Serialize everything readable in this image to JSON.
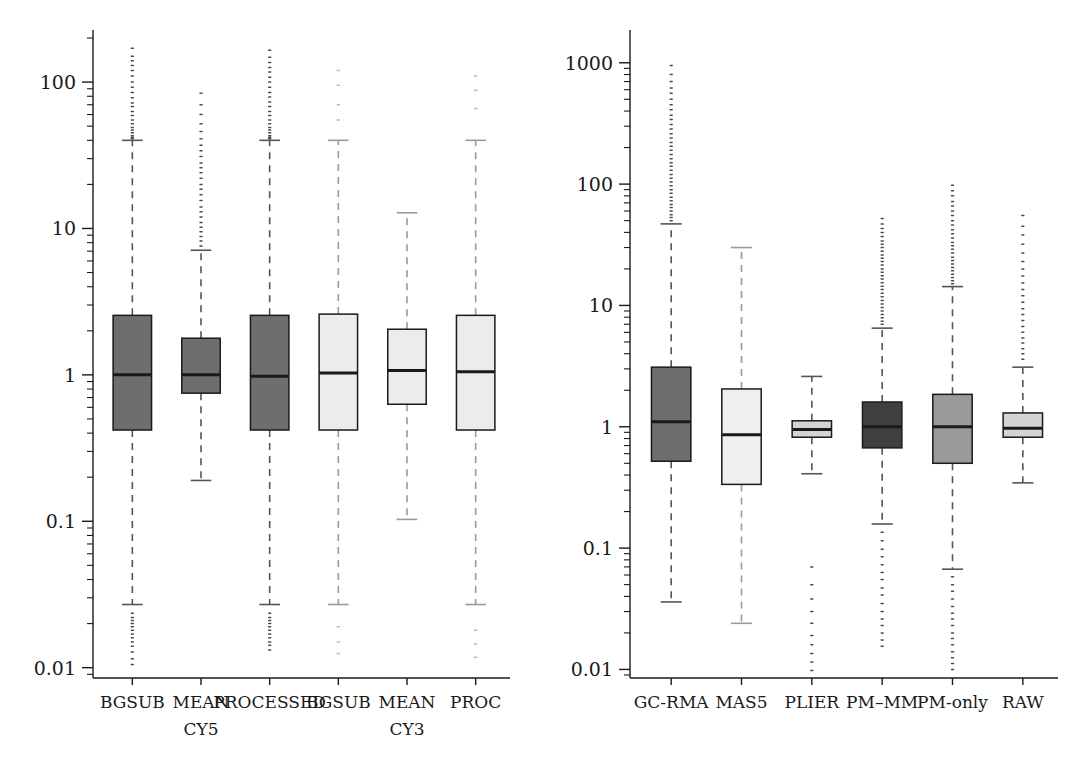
{
  "figure": {
    "type": "boxplot-figure",
    "panel_count": 2,
    "background": "#ffffff",
    "ink": "#1a1a1a"
  },
  "chart_data": [
    {
      "type": "box",
      "panel": "left",
      "title": "",
      "xlabel": "",
      "ylabel": "",
      "yscale": "log",
      "ylim": [
        0.0085,
        200
      ],
      "grid": false,
      "legend": "none",
      "ytick_labels": [
        "100",
        "10",
        "1",
        "0.1",
        "0.01"
      ],
      "ytick_values": [
        100,
        10,
        1,
        0.1,
        0.01
      ],
      "categories": [
        "BGSUB",
        "MEAN CY5",
        "PROCESSED",
        "BGSUB",
        "MEAN CY3",
        "PROC"
      ],
      "category_lines": [
        [
          "BGSUB",
          ""
        ],
        [
          "MEAN",
          "CY5"
        ],
        [
          "PROCESSED",
          ""
        ],
        [
          "BGSUB",
          ""
        ],
        [
          "MEAN",
          "CY3"
        ],
        [
          "PROC",
          ""
        ]
      ],
      "boxes": [
        {
          "label": "BGSUB",
          "fill": "#6e6e6e",
          "q1": 0.42,
          "median": 1.0,
          "q3": 2.55,
          "whisker_low": 0.027,
          "whisker_high": 40,
          "outliers_high": [
            170,
            150,
            140,
            130,
            120,
            110,
            100,
            92,
            85,
            78,
            72,
            68,
            63,
            59,
            55,
            52,
            49,
            47,
            45,
            43,
            42,
            41
          ],
          "outliers_low": [
            0.0235,
            0.022,
            0.021,
            0.02,
            0.019,
            0.018,
            0.017,
            0.016,
            0.015,
            0.014,
            0.0128,
            0.0115,
            0.0105
          ]
        },
        {
          "label": "MEAN CY5",
          "fill": "#6e6e6e",
          "q1": 0.75,
          "median": 1.0,
          "q3": 1.78,
          "whisker_low": 0.19,
          "whisker_high": 7.1,
          "outliers_high": [
            84,
            70,
            60,
            52,
            46,
            41,
            37,
            34,
            31,
            28,
            26,
            24,
            22,
            20,
            18.5,
            17,
            15.5,
            14,
            13,
            12,
            11,
            10.2,
            9.5,
            8.8,
            8.2,
            7.6
          ],
          "outliers_low": []
        },
        {
          "label": "PROCESSED",
          "fill": "#6e6e6e",
          "q1": 0.42,
          "median": 0.98,
          "q3": 2.55,
          "whisker_low": 0.027,
          "whisker_high": 40,
          "outliers_high": [
            165,
            148,
            136,
            126,
            117,
            108,
            100,
            92,
            85,
            79,
            73,
            68,
            63,
            59,
            55,
            52,
            49,
            47,
            45,
            43,
            42,
            41
          ],
          "outliers_low": [
            0.0235,
            0.022,
            0.021,
            0.02,
            0.019,
            0.018,
            0.017,
            0.016,
            0.015,
            0.0142,
            0.0132
          ]
        },
        {
          "label": "BGSUB",
          "fill": "#ececec",
          "q1": 0.42,
          "median": 1.03,
          "q3": 2.6,
          "whisker_low": 0.027,
          "whisker_high": 40,
          "outliers_high": [
            120,
            95,
            70,
            55
          ],
          "outliers_low": [
            0.019,
            0.015,
            0.0125
          ]
        },
        {
          "label": "MEAN CY3",
          "fill": "#ececec",
          "q1": 0.63,
          "median": 1.07,
          "q3": 2.05,
          "whisker_low": 0.103,
          "whisker_high": 12.8,
          "outliers_high": [],
          "outliers_low": []
        },
        {
          "label": "PROC",
          "fill": "#ececec",
          "q1": 0.42,
          "median": 1.05,
          "q3": 2.55,
          "whisker_low": 0.027,
          "whisker_high": 40,
          "outliers_high": [
            110,
            88,
            66
          ],
          "outliers_low": [
            0.018,
            0.0145,
            0.0118
          ]
        }
      ]
    },
    {
      "type": "box",
      "panel": "right",
      "title": "",
      "xlabel": "",
      "ylabel": "",
      "yscale": "log",
      "ylim": [
        0.0085,
        1600
      ],
      "grid": false,
      "legend": "none",
      "ytick_labels": [
        "1000",
        "100",
        "10",
        "1",
        "0.1",
        "0.01"
      ],
      "ytick_values": [
        1000,
        100,
        10,
        1,
        0.1,
        0.01
      ],
      "categories": [
        "GC-RMA",
        "MAS5",
        "PLIER",
        "PM–MM",
        "PM-only",
        "RAW"
      ],
      "category_lines": [
        [
          "GC-RMA",
          ""
        ],
        [
          "MAS5",
          ""
        ],
        [
          "PLIER",
          ""
        ],
        [
          "PM–MM",
          ""
        ],
        [
          "PM-only",
          ""
        ],
        [
          "RAW",
          ""
        ]
      ],
      "boxes": [
        {
          "label": "GC-RMA",
          "fill": "#6e6e6e",
          "q1": 0.52,
          "median": 1.1,
          "q3": 3.1,
          "whisker_low": 0.036,
          "whisker_high": 47,
          "outliers_high": [
            950,
            800,
            700,
            620,
            560,
            500,
            450,
            410,
            370,
            340,
            310,
            285,
            260,
            240,
            220,
            205,
            190,
            175,
            162,
            150,
            140,
            130,
            120,
            112,
            104,
            97,
            90,
            84,
            78,
            73,
            68,
            64,
            60,
            56,
            53,
            50
          ],
          "outliers_low": []
        },
        {
          "label": "MAS5",
          "fill": "#efefef",
          "q1": 0.335,
          "median": 0.86,
          "q3": 2.05,
          "whisker_low": 0.024,
          "whisker_high": 30,
          "outliers_high": [],
          "outliers_low": []
        },
        {
          "label": "PLIER",
          "fill": "#d4d4d4",
          "q1": 0.82,
          "median": 0.95,
          "q3": 1.12,
          "whisker_low": 0.41,
          "whisker_high": 2.6,
          "outliers_high": [],
          "outliers_low": [
            0.07,
            0.05,
            0.038,
            0.03,
            0.024,
            0.019,
            0.016,
            0.0135,
            0.0115,
            0.0098
          ]
        },
        {
          "label": "PM–MM",
          "fill": "#404040",
          "q1": 0.67,
          "median": 1.0,
          "q3": 1.6,
          "whisker_low": 0.158,
          "whisker_high": 6.5,
          "outliers_high": [
            52,
            47,
            43,
            40,
            37,
            34,
            32,
            30,
            28,
            26,
            24.5,
            23,
            21.5,
            20,
            18.8,
            17.6,
            16.5,
            15.4,
            14.4,
            13.5,
            12.6,
            11.8,
            11,
            10.3,
            9.6,
            9,
            8.4,
            7.9,
            7.4,
            7
          ],
          "outliers_low": [
            0.135,
            0.115,
            0.098,
            0.085,
            0.073,
            0.063,
            0.055,
            0.047,
            0.041,
            0.035,
            0.03,
            0.026,
            0.023,
            0.02,
            0.0175,
            0.0155
          ]
        },
        {
          "label": "PM-only",
          "fill": "#9a9a9a",
          "q1": 0.5,
          "median": 1.0,
          "q3": 1.85,
          "whisker_low": 0.067,
          "whisker_high": 14.3,
          "outliers_high": [
            98,
            88,
            80,
            72,
            66,
            60,
            55,
            50,
            46,
            42,
            39,
            36,
            33,
            31,
            29,
            27,
            25,
            23.5,
            22,
            20.5,
            19.3,
            18.1,
            17,
            16,
            15.1
          ],
          "outliers_low": [
            0.058,
            0.05,
            0.044,
            0.038,
            0.033,
            0.029,
            0.026,
            0.023,
            0.02,
            0.018,
            0.016,
            0.014,
            0.0125,
            0.0112,
            0.01
          ]
        },
        {
          "label": "RAW",
          "fill": "#d4d4d4",
          "q1": 0.82,
          "median": 0.97,
          "q3": 1.3,
          "whisker_low": 0.345,
          "whisker_high": 3.1,
          "outliers_high": [
            55,
            45,
            38,
            32,
            27,
            23,
            20,
            17.5,
            15.3,
            13.5,
            12,
            10.6,
            9.4,
            8.4,
            7.5,
            6.7,
            6.0,
            5.4,
            4.9,
            4.4,
            4.0,
            3.6
          ],
          "outliers_low": []
        }
      ]
    }
  ]
}
